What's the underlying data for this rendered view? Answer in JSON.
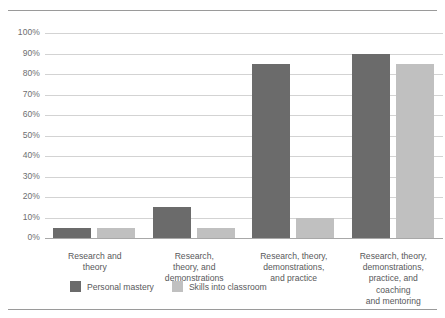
{
  "chart_data": {
    "type": "bar",
    "title": "",
    "subtitle": "",
    "xlabel": "",
    "ylabel": "",
    "ylim": [
      0,
      100
    ],
    "ytick_step": 10,
    "ytick_labels": [
      "0%",
      "10%",
      "20%",
      "30%",
      "40%",
      "50%",
      "60%",
      "70%",
      "80%",
      "90%",
      "100%"
    ],
    "ytick_values": [
      0,
      10,
      20,
      30,
      40,
      50,
      60,
      70,
      80,
      90,
      100
    ],
    "grid": "horizontal",
    "legend_position": "bottom-left",
    "categories": [
      "Research and theory",
      "Research, theory, and demonstrations",
      "Research, theory, demonstrations, and practice",
      "Research, theory, demonstrations, practice, and coaching and mentoring"
    ],
    "category_lines": [
      [
        "Research and",
        "theory"
      ],
      [
        "Research,",
        "theory, and",
        "demonstrations"
      ],
      [
        "Research, theory,",
        "demonstrations,",
        "and practice"
      ],
      [
        "Research, theory,",
        "demonstrations,",
        "practice, and",
        "coaching",
        "and mentoring"
      ]
    ],
    "series": [
      {
        "name": "Personal mastery",
        "color": "#6b6b6b",
        "values": [
          5,
          15,
          85,
          90
        ]
      },
      {
        "name": "Skills into classroom",
        "color": "#c0c0c0",
        "values": [
          5,
          5,
          10,
          85
        ]
      }
    ]
  },
  "colors": {
    "series_dark": "#6b6b6b",
    "series_light": "#c0c0c0",
    "gridline": "#d3d3d3",
    "axis": "#a8a8a8",
    "rule": "#9a9a9a",
    "text": "#58595b",
    "tick_text": "#6d6e71",
    "background": "#ffffff"
  }
}
